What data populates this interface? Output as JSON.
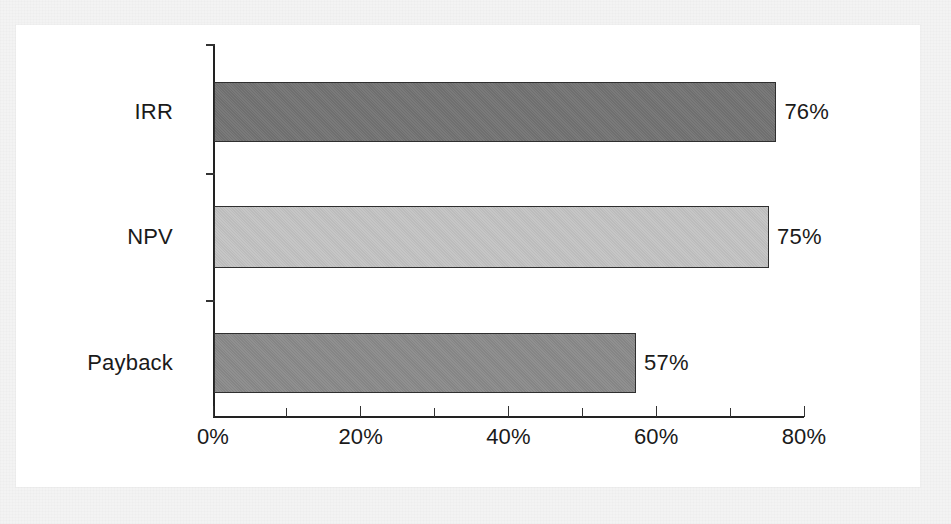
{
  "figure": {
    "background_color": "#f3f3f3",
    "panel_color": "#ffffff",
    "axis_color": "#222222",
    "text_color": "#1a1a1a"
  },
  "chart_data": {
    "type": "bar",
    "orientation": "horizontal",
    "title": "",
    "subtitle": "",
    "xlabel": "",
    "ylabel": "",
    "categories": [
      "IRR",
      "NPV",
      "Payback"
    ],
    "values": [
      76,
      75,
      57
    ],
    "value_labels": [
      "76%",
      "75%",
      "57%"
    ],
    "bar_colors": [
      "#737373",
      "#c3c3c3",
      "#8a8a8a"
    ],
    "bar_edge_color": "#2f2f2f",
    "xlim": [
      0,
      80
    ],
    "xticks": [
      0,
      10,
      20,
      30,
      40,
      50,
      60,
      70,
      80
    ],
    "xtick_labels_major": [
      "0%",
      "20%",
      "40%",
      "60%",
      "80%"
    ],
    "xtick_major_values": [
      0,
      20,
      40,
      60,
      80
    ],
    "grid": false,
    "legend": null,
    "annotations": []
  },
  "axis": {
    "x_labels": [
      {
        "text": "0%",
        "value": 0
      },
      {
        "text": "20%",
        "value": 20
      },
      {
        "text": "40%",
        "value": 40
      },
      {
        "text": "60%",
        "value": 60
      },
      {
        "text": "80%",
        "value": 80
      }
    ]
  },
  "bars": [
    {
      "category": "IRR",
      "value": 76,
      "label": "76%",
      "color": "#737373"
    },
    {
      "category": "NPV",
      "value": 75,
      "label": "75%",
      "color": "#c3c3c3"
    },
    {
      "category": "Payback",
      "value": 57,
      "label": "57%",
      "color": "#8a8a8a"
    }
  ]
}
